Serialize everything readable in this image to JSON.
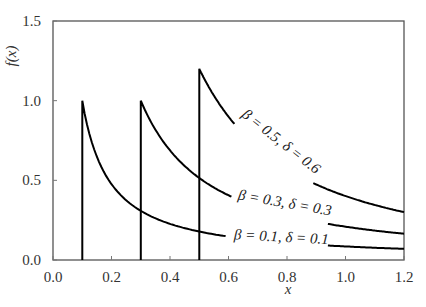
{
  "chart_data": {
    "type": "line",
    "title": "",
    "xlabel": "x",
    "ylabel": "f(x)",
    "xlim": [
      0.0,
      1.2
    ],
    "ylim": [
      0.0,
      1.5
    ],
    "x_ticks": [
      "0.0",
      "0.2",
      "0.4",
      "0.6",
      "0.8",
      "1.0",
      "1.2"
    ],
    "y_ticks": [
      "0.0",
      "0.5",
      "1.0",
      "1.5"
    ],
    "grid": false,
    "legend": "inline labels along curves",
    "series": [
      {
        "name": "β = 0.1, δ = 0.1",
        "start_x": 0.1,
        "peak": 1.0,
        "decay_exponent": 1.07,
        "label_gap": [
          0.59,
          0.94
        ],
        "points": [
          [
            0.1,
            0.0
          ],
          [
            0.1,
            1.0
          ],
          [
            0.2,
            0.48
          ],
          [
            0.3,
            0.3
          ],
          [
            0.4,
            0.23
          ],
          [
            0.5,
            0.17
          ],
          [
            0.6,
            0.15
          ],
          [
            0.8,
            0.11
          ],
          [
            1.0,
            0.085
          ],
          [
            1.2,
            0.07
          ]
        ]
      },
      {
        "name": "β = 0.3, δ = 0.3",
        "start_x": 0.3,
        "peak": 1.0,
        "decay_exponent": 1.3,
        "label_gap": [
          0.61,
          0.94
        ],
        "points": [
          [
            0.3,
            0.0
          ],
          [
            0.3,
            1.0
          ],
          [
            0.4,
            0.69
          ],
          [
            0.5,
            0.52
          ],
          [
            0.6,
            0.41
          ],
          [
            0.8,
            0.28
          ],
          [
            1.0,
            0.21
          ],
          [
            1.2,
            0.17
          ]
        ]
      },
      {
        "name": "β = 0.5, δ = 0.6",
        "start_x": 0.5,
        "peak": 1.2,
        "decay_exponent": 1.58,
        "label_gap": [
          0.62,
          0.89
        ],
        "points": [
          [
            0.5,
            0.0
          ],
          [
            0.5,
            1.2
          ],
          [
            0.6,
            0.9
          ],
          [
            0.7,
            0.7
          ],
          [
            0.8,
            0.57
          ],
          [
            0.9,
            0.47
          ],
          [
            1.0,
            0.4
          ],
          [
            1.1,
            0.35
          ],
          [
            1.2,
            0.3
          ]
        ]
      }
    ],
    "annotations": [
      {
        "text": "β = 0.5, δ = 0.6",
        "x": 0.77,
        "y": 0.72,
        "angle": 38
      },
      {
        "text": "β = 0.3, δ = 0.3",
        "x": 0.79,
        "y": 0.33,
        "angle": 10
      },
      {
        "text": "β = 0.1, δ = 0.1",
        "x": 0.78,
        "y": 0.115,
        "angle": 3
      }
    ]
  },
  "labels": {
    "xlabel": "x",
    "ylabel": "f(x)",
    "curve_1": "β = 0.1, δ = 0.1",
    "curve_2": "β = 0.3, δ = 0.3",
    "curve_3": "β = 0.5, δ = 0.6"
  }
}
